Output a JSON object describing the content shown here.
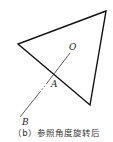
{
  "figure": {
    "labels": {
      "O": "O",
      "A": "A",
      "B": "B"
    },
    "caption": "（b）参照角度旋转后",
    "shapes": {
      "triangle": {
        "points": [
          [
            106,
            11
          ],
          [
            18,
            44
          ],
          [
            90,
            105
          ]
        ],
        "stroke": "#111111"
      },
      "ray_OB": {
        "from": [
          70,
          53
        ],
        "to": [
          20,
          117
        ],
        "stroke": "#333333",
        "dashed_near": [
          44,
          88
        ]
      }
    }
  }
}
